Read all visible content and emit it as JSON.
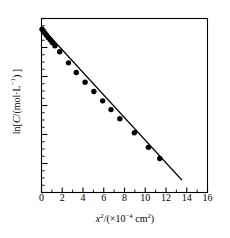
{
  "chart_data": {
    "type": "scatter",
    "title": "",
    "xlabel": "x²/(×10⁻⁴ cm²)",
    "ylabel": "ln[C/(mol·L⁻¹)]",
    "xlim": [
      0,
      16
    ],
    "ylim": [
      -6.2,
      0.35
    ],
    "grid": false,
    "legend": null,
    "xticks": [
      0,
      2,
      4,
      6,
      8,
      10,
      12,
      14,
      16
    ],
    "xtick_labels": [
      "0",
      "2",
      "4",
      "6",
      "8",
      "10",
      "12",
      "14",
      "16"
    ],
    "x_minor_tick_interval": 1,
    "yticks_labeled": false,
    "y_major_tick_count": 7,
    "y_minor_per_major": 4,
    "marker": "filled-circle",
    "marker_color": "#000000",
    "line_color": "#000000",
    "series": [
      {
        "name": "ln C vs x²",
        "x": [
          0.05,
          0.18,
          0.32,
          0.48,
          0.66,
          0.85,
          1.05,
          1.3,
          1.75,
          2.6,
          3.35,
          4.2,
          5.05,
          5.9,
          6.7,
          7.55,
          8.95,
          10.3,
          11.4
        ],
        "y": [
          -0.05,
          -0.12,
          -0.2,
          -0.28,
          -0.37,
          -0.46,
          -0.56,
          -0.68,
          -0.9,
          -1.32,
          -1.68,
          -2.05,
          -2.4,
          -2.75,
          -3.08,
          -3.42,
          -3.95,
          -4.5,
          -4.92
        ]
      }
    ],
    "fit_line": {
      "x_start": 0.0,
      "x_end": 13.5,
      "y_start": 0.02,
      "y_end": -5.72,
      "slope": -0.425,
      "intercept": 0.02
    }
  },
  "axis_label_parts": {
    "x_var": "x",
    "x_exp": "2",
    "x_unit_prefix": "/(×10",
    "x_unit_exp": "−4",
    "x_unit_suffix": " cm",
    "x_unit_suffix_exp": "2",
    "x_close": ")",
    "y_prefix": "ln[",
    "y_var": "C",
    "y_mid": "/(mol·L",
    "y_exp": "−1",
    "y_suffix": ") ]"
  },
  "colors": {
    "background": "#ffffff",
    "axis": "#000000",
    "data": "#000000"
  }
}
